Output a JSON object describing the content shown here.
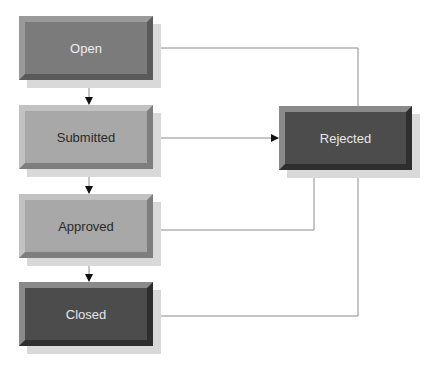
{
  "diagram": {
    "type": "state-flow",
    "nodes": [
      {
        "id": "open",
        "label": "Open",
        "x": 19,
        "y": 16,
        "w": 134,
        "h": 64,
        "fill": "#7b7b7b",
        "bevel_light": "#9a9a9a",
        "bevel_dark": "#5a5a5a",
        "text": "#eeeeee"
      },
      {
        "id": "submitted",
        "label": "Submitted",
        "x": 19,
        "y": 105,
        "w": 134,
        "h": 64,
        "fill": "#a8a8a8",
        "bevel_light": "#c2c2c2",
        "bevel_dark": "#7e7e7e",
        "text": "#2a2a2a"
      },
      {
        "id": "approved",
        "label": "Approved",
        "x": 19,
        "y": 194,
        "w": 134,
        "h": 64,
        "fill": "#a8a8a8",
        "bevel_light": "#c2c2c2",
        "bevel_dark": "#7e7e7e",
        "text": "#2a2a2a"
      },
      {
        "id": "closed",
        "label": "Closed",
        "x": 19,
        "y": 282,
        "w": 134,
        "h": 64,
        "fill": "#4c4c4c",
        "bevel_light": "#8a8a8a",
        "bevel_dark": "#2e2e2e",
        "text": "#e6e6e6"
      },
      {
        "id": "rejected",
        "label": "Rejected",
        "x": 279,
        "y": 106,
        "w": 133,
        "h": 64,
        "fill": "#4c4c4c",
        "bevel_light": "#8a8a8a",
        "bevel_dark": "#2e2e2e",
        "text": "#e6e6e6"
      }
    ],
    "edges": [
      {
        "from": "open",
        "to": "submitted"
      },
      {
        "from": "submitted",
        "to": "approved"
      },
      {
        "from": "approved",
        "to": "closed"
      },
      {
        "from": "submitted",
        "to": "rejected"
      },
      {
        "from": "approved",
        "to": "rejected"
      },
      {
        "from": "rejected",
        "to": "open"
      },
      {
        "from": "rejected",
        "to": "closed"
      }
    ],
    "edge_color": "#8c8c8c",
    "arrow_color": "#111111"
  }
}
